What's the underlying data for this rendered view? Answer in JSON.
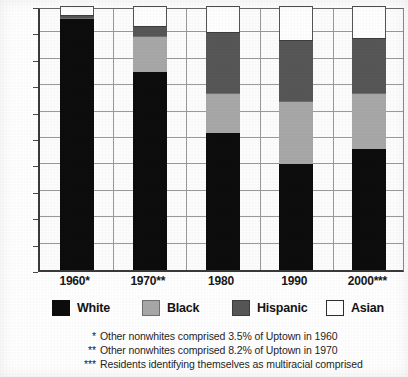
{
  "chart_data": {
    "type": "bar",
    "stacked": true,
    "title": "",
    "xlabel": "",
    "ylabel": "",
    "ylim": [
      0,
      100
    ],
    "grid": true,
    "legend_position": "bottom",
    "categories": [
      "1960*",
      "1970**",
      "1980",
      "1990",
      "2000***"
    ],
    "ytick_labels": [
      "0%",
      "10%",
      "20%",
      "30%",
      "40%",
      "50%",
      "60%",
      "70%",
      "80%",
      "90%",
      "100%"
    ],
    "ytick_values": [
      0,
      10,
      20,
      30,
      40,
      50,
      60,
      70,
      80,
      90,
      100
    ],
    "series": [
      {
        "name": "White",
        "color": "#0d0d0d",
        "values": [
          95.0,
          75.0,
          52.0,
          40.0,
          46.0
        ]
      },
      {
        "name": "Black",
        "color": "#a8a8a8",
        "values": [
          0.5,
          13.7,
          15.0,
          24.0,
          21.0
        ]
      },
      {
        "name": "Hispanic",
        "color": "#575757",
        "values": [
          1.0,
          3.8,
          23.0,
          23.0,
          21.0
        ]
      },
      {
        "name": "Asian",
        "color": "#ffffff",
        "values": [
          3.5,
          7.5,
          10.0,
          13.0,
          12.0
        ]
      }
    ],
    "cumulative_tops": {
      "1960*": {
        "white": 95.0,
        "black": 95.5,
        "hispanic": 96.5,
        "asian": 100.0
      },
      "1970**": {
        "white": 75.0,
        "black": 88.7,
        "hispanic": 92.5,
        "asian": 100.0
      },
      "1980": {
        "white": 52.0,
        "black": 67.0,
        "hispanic": 90.0,
        "asian": 100.0
      },
      "1990": {
        "white": 40.0,
        "black": 64.0,
        "hispanic": 87.0,
        "asian": 100.0
      },
      "2000***": {
        "white": 46.0,
        "black": 67.0,
        "hispanic": 88.0,
        "asian": 100.0
      }
    },
    "annotations": [
      "* Other nonwhites comprised 3.5% of Uptown in 1960",
      "** Other nonwhites comprised 8.2% of Uptown in 1970",
      "*** Residents identifying themselves as multiracial comprised"
    ]
  },
  "axis": {
    "y": {
      "ticks": [
        {
          "label": "100%",
          "value": 100
        },
        {
          "label": "90%",
          "value": 90
        },
        {
          "label": "80%",
          "value": 80
        },
        {
          "label": "70%",
          "value": 70
        },
        {
          "label": "60%",
          "value": 60
        },
        {
          "label": "50%",
          "value": 50
        },
        {
          "label": "40%",
          "value": 40
        },
        {
          "label": "30%",
          "value": 30
        },
        {
          "label": "20%",
          "value": 20
        },
        {
          "label": "10%",
          "value": 10
        },
        {
          "label": "0%",
          "value": 0
        }
      ]
    },
    "x": {
      "ticks": [
        {
          "label": "1960*"
        },
        {
          "label": "1970**"
        },
        {
          "label": "1980"
        },
        {
          "label": "1990"
        },
        {
          "label": "2000***"
        }
      ]
    }
  },
  "legend": {
    "items": [
      {
        "label": "White",
        "swatch": "#0d0d0d"
      },
      {
        "label": "Black",
        "swatch": "#a8a8a8"
      },
      {
        "label": "Hispanic",
        "swatch": "#575757"
      },
      {
        "label": "Asian",
        "swatch": "#ffffff"
      }
    ]
  },
  "footnotes": [
    {
      "mark": "*",
      "text": "Other nonwhites comprised 3.5% of Uptown in 1960"
    },
    {
      "mark": "**",
      "text": "Other nonwhites comprised 8.2% of Uptown in 1970"
    },
    {
      "mark": "***",
      "text": "Residents identifying themselves as multiracial comprised"
    }
  ]
}
